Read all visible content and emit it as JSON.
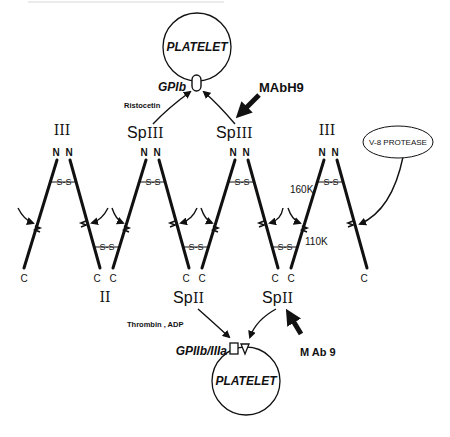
{
  "header": {
    "caption_fragment": ""
  },
  "platelet_top": {
    "label": "PLATELET",
    "receptor_label": "GPIb"
  },
  "platelet_bottom": {
    "label": "PLATELET",
    "receptor_label": "GPIIb/IIIa"
  },
  "agonists": {
    "top": "Ristocetin",
    "bottom": "Thrombin , ADP"
  },
  "antibodies": {
    "top": "MAbH9",
    "bottom": "M Ab 9"
  },
  "enzyme": {
    "label": "V-8 PROTEASE"
  },
  "domains": {
    "top": [
      "III",
      "Sp",
      "III",
      "Sp",
      "III",
      "III"
    ],
    "top_labels": [
      {
        "prefix": "",
        "roman": "III"
      },
      {
        "prefix": "Sp",
        "roman": "III"
      },
      {
        "prefix": "Sp",
        "roman": "III"
      },
      {
        "prefix": "",
        "roman": "III"
      }
    ],
    "bottom_labels": [
      {
        "prefix": "",
        "roman": "II"
      },
      {
        "prefix": "Sp",
        "roman": "II"
      },
      {
        "prefix": "Sp",
        "roman": "II"
      }
    ]
  },
  "termini": {
    "n": "N",
    "c": "C"
  },
  "disulfide": "S-S",
  "fragments": {
    "upper": "160K",
    "lower": "110K"
  }
}
